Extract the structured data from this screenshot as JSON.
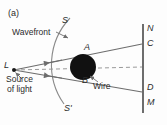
{
  "figure": {
    "panel_tag": "(a)",
    "caption_labels": {
      "wavefront": "Wavefront",
      "source_line1": "Source",
      "source_line2": "of light",
      "wire": "Wire"
    },
    "point_labels": {
      "S": "S",
      "S_prime": "S'",
      "L": "L",
      "A": "A",
      "B": "B",
      "N": "N",
      "C": "C",
      "D": "D",
      "M": "M"
    },
    "colors": {
      "ink": "#2b2b2b",
      "line": "#6d6d6d",
      "obstacle": "#111111",
      "background": "#fdfdfd"
    }
  }
}
